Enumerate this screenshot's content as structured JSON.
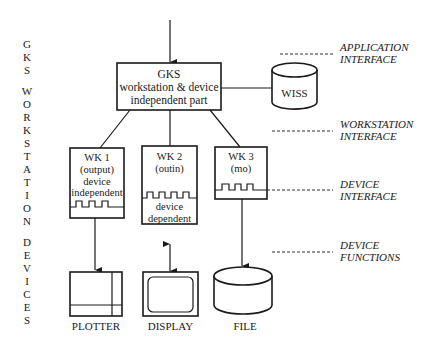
{
  "side_label": {
    "word1": [
      "G",
      "K",
      "S"
    ],
    "word2": [
      "W",
      "O",
      "R",
      "K",
      "S",
      "T",
      "A",
      "T",
      "I",
      "O",
      "N"
    ],
    "word3": [
      "D",
      "E",
      "V",
      "I",
      "C",
      "E",
      "S"
    ]
  },
  "gks_box": {
    "line1": "GKS",
    "line2": "workstation & device",
    "line3": "independent part"
  },
  "wiss": {
    "label": "WISS"
  },
  "workstations": [
    {
      "title": "WK 1",
      "mode": "(output)",
      "note1": "device",
      "note2": "independent"
    },
    {
      "title": "WK 2",
      "mode": "(outin)",
      "note1": "device",
      "note2": "dependent"
    },
    {
      "title": "WK 3",
      "mode": "(mo)",
      "note1": "",
      "note2": ""
    }
  ],
  "devices": [
    {
      "label": "PLOTTER"
    },
    {
      "label": "DISPLAY"
    },
    {
      "label": "FILE"
    }
  ],
  "interfaces": [
    {
      "line1": "APPLICATION",
      "line2": "INTERFACE"
    },
    {
      "line1": "WORKSTATION",
      "line2": "INTERFACE"
    },
    {
      "line1": "DEVICE",
      "line2": "INTERFACE"
    },
    {
      "line1": "DEVICE",
      "line2": "FUNCTIONS"
    }
  ]
}
